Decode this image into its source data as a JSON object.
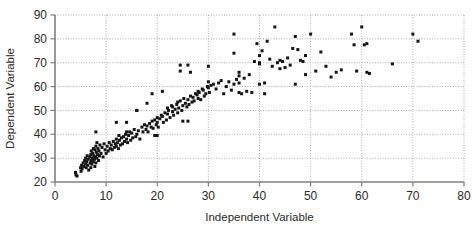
{
  "chart_data": {
    "type": "scatter",
    "title": "",
    "xlabel": "Independent Variable",
    "ylabel": "Dependent Variable",
    "xlim": [
      0,
      80
    ],
    "ylim": [
      20,
      90
    ],
    "xticks": [
      0,
      10,
      20,
      30,
      40,
      50,
      60,
      70,
      80
    ],
    "yticks": [
      20,
      30,
      40,
      50,
      60,
      70,
      80,
      90
    ],
    "grid": true,
    "legend": "none",
    "marker": "square",
    "marker_color": "#151515",
    "marker_size_px": 3,
    "series": [
      {
        "name": "observations",
        "x": [
          4.0,
          4.1,
          4.3,
          5.0,
          5.1,
          5.2,
          5.3,
          5.5,
          5.6,
          5.8,
          6.0,
          6.0,
          6.1,
          6.2,
          6.3,
          6.4,
          6.5,
          6.6,
          6.8,
          6.9,
          7.0,
          7.0,
          7.1,
          7.1,
          7.2,
          7.3,
          7.4,
          7.5,
          7.5,
          7.6,
          7.7,
          7.8,
          7.8,
          7.9,
          8.0,
          8.0,
          8.1,
          8.2,
          8.2,
          8.3,
          8.4,
          8.5,
          8.6,
          8.7,
          8.8,
          9.0,
          9.2,
          9.4,
          9.6,
          9.8,
          10.0,
          10.2,
          10.4,
          10.6,
          10.8,
          11.0,
          11.2,
          11.4,
          11.6,
          11.8,
          12.0,
          12.0,
          12.2,
          12.4,
          12.5,
          12.6,
          12.8,
          13.0,
          13.2,
          13.4,
          13.6,
          13.8,
          14.0,
          14.0,
          14.2,
          14.4,
          14.6,
          14.8,
          15.0,
          15.2,
          15.5,
          15.8,
          16.0,
          16.0,
          16.3,
          16.6,
          17.0,
          17.2,
          17.5,
          17.8,
          18.0,
          18.0,
          18.2,
          18.5,
          18.8,
          19.0,
          19.0,
          19.2,
          19.5,
          19.8,
          20.0,
          20.0,
          20.0,
          20.2,
          20.5,
          20.8,
          21.0,
          21.0,
          21.2,
          21.5,
          21.8,
          22.0,
          22.0,
          22.2,
          22.5,
          22.8,
          23.0,
          23.0,
          23.2,
          23.5,
          23.8,
          24.0,
          24.0,
          24.2,
          24.5,
          24.8,
          25.0,
          25.0,
          25.2,
          25.5,
          25.8,
          26.0,
          26.0,
          26.2,
          26.5,
          26.8,
          27.0,
          27.2,
          27.5,
          27.8,
          28.0,
          28.0,
          28.2,
          28.5,
          28.8,
          29.0,
          29.2,
          29.5,
          29.8,
          30.0,
          30.0,
          30.0,
          30.2,
          30.5,
          31.0,
          31.5,
          32.0,
          32.5,
          33.0,
          33.5,
          34.0,
          34.5,
          35.0,
          35.0,
          35.0,
          35.5,
          36.0,
          36.0,
          36.0,
          36.0,
          36.5,
          37.0,
          37.5,
          38.0,
          38.5,
          39.0,
          39.5,
          40.0,
          40.0,
          40.0,
          40.0,
          40.5,
          41.0,
          41.0,
          41.5,
          42.0,
          42.5,
          43.0,
          43.5,
          44.0,
          44.0,
          44.5,
          45.0,
          45.5,
          46.0,
          46.5,
          47.0,
          47.0,
          47.5,
          48.0,
          48.5,
          49.0,
          49.0,
          50.0,
          51.0,
          52.0,
          53.0,
          54.0,
          55.0,
          56.0,
          58.0,
          58.5,
          59.0,
          60.0,
          60.5,
          61.0,
          61.0,
          61.5,
          66.0,
          70.0,
          71.0,
          24.5,
          24.5,
          26.5,
          26.0,
          19.5,
          14.0,
          12.0,
          8.0,
          16.0
        ],
        "y": [
          24.0,
          23.0,
          22.5,
          26.0,
          24.5,
          27.0,
          25.5,
          28.0,
          26.5,
          29.0,
          27.5,
          30.0,
          26.0,
          28.5,
          31.0,
          27.0,
          29.5,
          25.0,
          30.5,
          28.0,
          26.0,
          31.5,
          29.0,
          33.0,
          27.5,
          30.0,
          32.0,
          28.5,
          34.0,
          31.0,
          29.5,
          26.5,
          33.5,
          30.5,
          28.0,
          35.0,
          32.5,
          30.0,
          36.5,
          31.5,
          34.0,
          29.0,
          33.0,
          31.0,
          35.5,
          32.0,
          34.5,
          30.5,
          36.0,
          33.5,
          32.0,
          35.0,
          33.0,
          36.5,
          34.0,
          35.5,
          33.5,
          37.0,
          34.5,
          36.0,
          35.0,
          38.0,
          36.5,
          34.0,
          39.5,
          37.5,
          35.5,
          38.5,
          36.0,
          39.0,
          37.0,
          40.0,
          38.0,
          45.0,
          36.5,
          39.5,
          41.0,
          37.5,
          40.5,
          38.5,
          42.0,
          39.0,
          40.0,
          50.0,
          41.5,
          38.0,
          43.0,
          41.0,
          44.0,
          42.0,
          43.5,
          53.0,
          41.0,
          44.5,
          43.0,
          45.5,
          57.0,
          42.5,
          46.0,
          44.0,
          45.0,
          47.0,
          39.5,
          43.0,
          46.5,
          48.0,
          47.5,
          58.0,
          45.0,
          49.0,
          46.0,
          48.5,
          51.0,
          50.0,
          47.0,
          52.0,
          49.5,
          51.5,
          48.0,
          50.5,
          52.5,
          49.0,
          53.5,
          51.0,
          54.0,
          50.0,
          45.5,
          52.0,
          55.0,
          53.0,
          51.5,
          54.5,
          45.5,
          52.5,
          56.0,
          53.5,
          55.5,
          54.0,
          57.0,
          56.5,
          55.0,
          58.0,
          57.5,
          54.5,
          59.0,
          58.5,
          56.0,
          57.0,
          60.0,
          59.5,
          62.0,
          68.5,
          57.5,
          60.5,
          61.0,
          59.0,
          61.5,
          62.5,
          57.0,
          60.0,
          62.0,
          58.5,
          74.0,
          82.0,
          61.0,
          63.0,
          64.5,
          66.0,
          61.5,
          57.5,
          57.0,
          63.5,
          58.0,
          65.0,
          57.5,
          70.5,
          78.0,
          69.5,
          70.0,
          73.0,
          61.0,
          75.0,
          57.0,
          61.5,
          79.0,
          71.5,
          68.5,
          85.0,
          70.0,
          71.0,
          67.5,
          70.5,
          68.0,
          72.0,
          69.0,
          76.0,
          81.0,
          61.0,
          75.5,
          71.0,
          70.5,
          73.0,
          65.0,
          82.0,
          66.5,
          74.5,
          68.5,
          64.0,
          66.0,
          67.0,
          82.0,
          77.5,
          66.5,
          85.0,
          77.5,
          78.0,
          66.0,
          65.5,
          69.5,
          82.0,
          79.0,
          66.5,
          69.0,
          66.0,
          69.0,
          39.5,
          41.0,
          45.0,
          41.0,
          50.0
        ]
      }
    ]
  },
  "axes": {
    "x_title": "Independent Variable",
    "y_title": "Dependent Variable",
    "x_tick_labels": [
      "0",
      "10",
      "20",
      "30",
      "40",
      "50",
      "60",
      "70",
      "80"
    ],
    "y_tick_labels": [
      "20",
      "30",
      "40",
      "50",
      "60",
      "70",
      "80",
      "90"
    ]
  },
  "colors": {
    "marker": "#151515",
    "axis": "#808080",
    "grid": "#9a9a9a",
    "text": "#2b2b2b",
    "background": "#ffffff"
  }
}
